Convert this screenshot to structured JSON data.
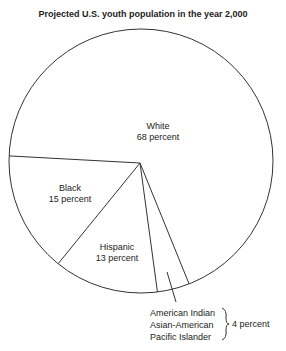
{
  "chart_data": {
    "type": "pie",
    "title": "Projected U.S. youth population in the year 2,000",
    "slices": [
      {
        "name": "White",
        "label_line2": "68 percent",
        "value": 68
      },
      {
        "name": "Other",
        "label_line2": "",
        "value": 4
      },
      {
        "name": "Hispanic",
        "label_line2": "13 percent",
        "value": 13
      },
      {
        "name": "Black",
        "label_line2": "15 percent",
        "value": 15
      }
    ],
    "other_breakdown": {
      "groups": [
        "American Indian",
        "Asian-American",
        "Pacific Islander"
      ],
      "combined_label": "4 percent",
      "combined_value": 4
    }
  }
}
